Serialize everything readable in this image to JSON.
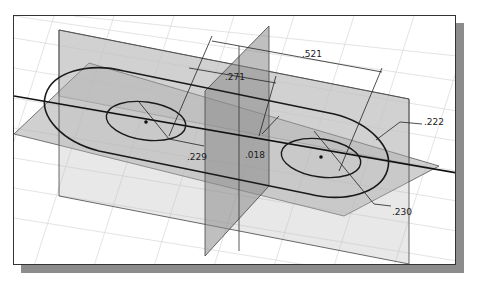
{
  "view": {
    "type": "3D sketch view",
    "colors": {
      "background": "#ffffff",
      "grid": "#d8d8d8",
      "plane_fill": "#b8b8b8",
      "plane_dark": "#8e8e8e",
      "sketch_line": "#1a1a1a",
      "shadow": "#8c8c8c"
    }
  },
  "dimensions": [
    {
      "id": "d521",
      "label": ".521"
    },
    {
      "id": "d271",
      "label": ".271"
    },
    {
      "id": "d222",
      "label": ".222"
    },
    {
      "id": "d229",
      "label": ".229"
    },
    {
      "id": "d018",
      "label": ".018"
    },
    {
      "id": "d230",
      "label": ".230"
    }
  ]
}
